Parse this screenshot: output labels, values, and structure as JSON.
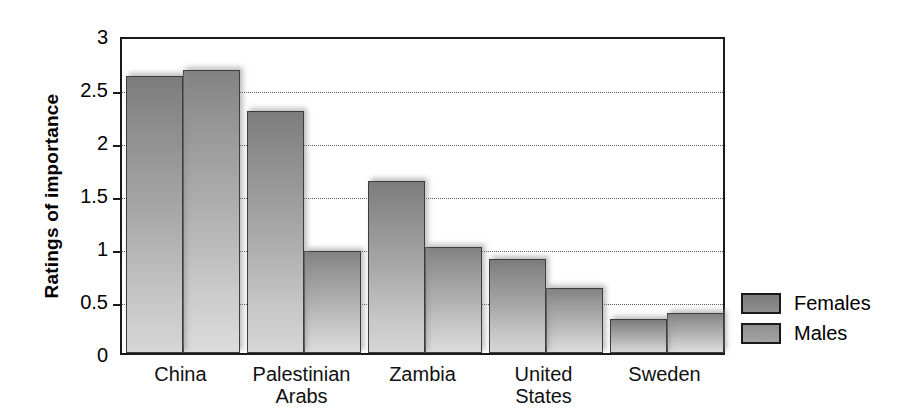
{
  "chart_data": {
    "type": "bar",
    "title": "",
    "xlabel": "",
    "ylabel": "Ratings of importance",
    "ylim": [
      0,
      3
    ],
    "yticks": [
      "0",
      "0.5",
      "1",
      "1.5",
      "2",
      "2.5",
      "3"
    ],
    "ytick_values": [
      0,
      0.5,
      1,
      1.5,
      2,
      2.5,
      3
    ],
    "grid": "horizontal-dotted",
    "legend_position": "right",
    "categories": [
      "China",
      "Palestinian\nArabs",
      "Zambia",
      "United\nStates",
      "Sweden"
    ],
    "series": [
      {
        "name": "Females",
        "color": "#8d8d8d",
        "values": [
          2.61,
          2.28,
          1.62,
          0.89,
          0.32
        ]
      },
      {
        "name": "Males",
        "color": "#a3a3a3",
        "values": [
          2.67,
          0.96,
          1.0,
          0.61,
          0.38
        ]
      }
    ]
  },
  "legend": {
    "items": [
      {
        "label": "Females"
      },
      {
        "label": "Males"
      }
    ]
  }
}
